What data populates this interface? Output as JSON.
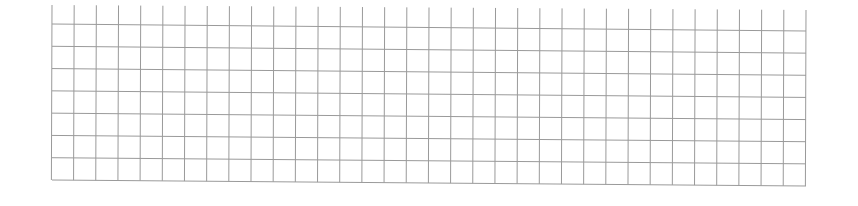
{
  "grid": {
    "description": "Blank ruled grid (graph paper), slightly skewed",
    "line_color": "#9a9a9a",
    "background": "#ffffff",
    "columns": 34,
    "rows": 7,
    "left_x": 52,
    "right_x": 806,
    "top_tick_y_left": 5,
    "top_tick_y_right": 10,
    "first_row_y_left": 24,
    "first_row_y_right": 31,
    "bottom_y_left": 180,
    "bottom_y_right": 186
  }
}
